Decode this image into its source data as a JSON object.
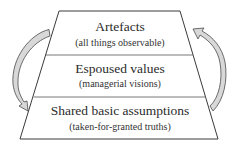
{
  "diagram": {
    "type": "layered-trapezoid",
    "colors": {
      "stroke": "#3a3a3a",
      "divider": "#6a6a6a",
      "arrow_fill": "#d8d8d8",
      "arrow_stroke": "#4a4a4a",
      "text": "#2b2b2b"
    },
    "layers": [
      {
        "title": "Artefacts",
        "subtitle": "(all things observable)"
      },
      {
        "title": "Espoused values",
        "subtitle": "(managerial visions)"
      },
      {
        "title": "Shared basic assumptions",
        "subtitle": "(taken-for-granted truths)"
      }
    ],
    "arrows": [
      {
        "side": "left",
        "direction": "top-to-bottom"
      },
      {
        "side": "right",
        "direction": "bottom-to-top"
      }
    ]
  }
}
